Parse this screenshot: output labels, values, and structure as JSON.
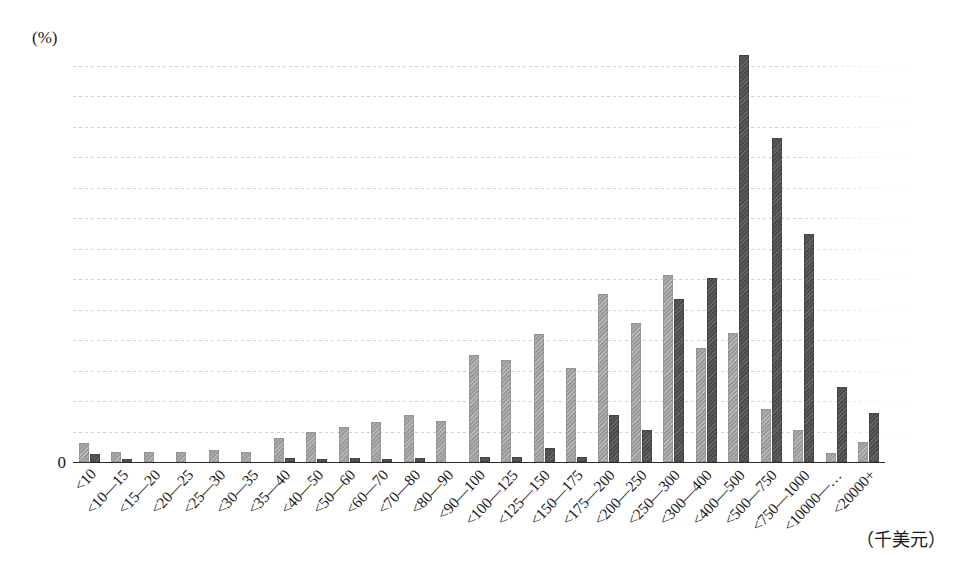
{
  "chart_data": {
    "type": "bar",
    "title": "",
    "xlabel": "（千美元）",
    "ylabel": "(%)",
    "ylim": [
      0,
      26
    ],
    "ytick_step": 2,
    "grid": true,
    "legend": "none",
    "yticks": [
      26,
      24,
      22,
      20,
      18,
      16,
      14,
      12,
      10,
      8,
      6,
      4,
      2,
      0
    ],
    "categories": [
      "<10",
      "<10—15",
      "<15—20",
      "<20—25",
      "<25—30",
      "<30—35",
      "<35—40",
      "<40—50",
      "<50—60",
      "<60—70",
      "<70—80",
      "<80—90",
      "<90—100",
      "<100—125",
      "<125—150",
      "<150—175",
      "<175—200",
      "<200—250",
      "<250—300",
      "<300—400",
      "<400—500",
      "<500—750",
      "<750—1000",
      "<10000—…",
      "<20000+"
    ],
    "series": [
      {
        "name": "series-light",
        "color": "#9b9b9b",
        "values": [
          1.25,
          0.65,
          0.65,
          0.65,
          0.8,
          0.65,
          1.6,
          2.0,
          2.3,
          2.6,
          3.1,
          2.7,
          7.0,
          6.7,
          8.4,
          6.2,
          11.0,
          9.1,
          12.3,
          7.5,
          8.5,
          3.5,
          2.1,
          0.6,
          1.3
        ]
      },
      {
        "name": "series-dark",
        "color": "#4b4b4b",
        "values": [
          0.55,
          0.18,
          0.0,
          0.0,
          0.0,
          0.0,
          0.25,
          0.2,
          0.25,
          0.2,
          0.25,
          0.0,
          0.3,
          0.3,
          0.9,
          0.35,
          3.1,
          2.1,
          10.7,
          12.1,
          26.7,
          21.3,
          15.0,
          4.95,
          3.25
        ]
      }
    ]
  }
}
